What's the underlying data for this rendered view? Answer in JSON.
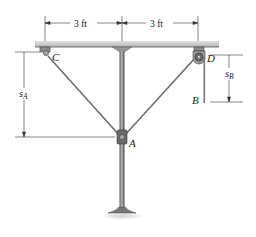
{
  "figure": {
    "dimensions": {
      "left_span": "3 ft",
      "right_span": "3 ft"
    },
    "labels": {
      "point_c": "C",
      "point_d": "D",
      "point_a": "A",
      "point_b": "B",
      "s_a_main": "s",
      "s_a_sub": "A",
      "s_b_main": "s",
      "s_b_sub": "B"
    },
    "colors": {
      "ceiling": "#c9c9c9",
      "post": "#8a8a8a",
      "cable": "#7a7a7a",
      "dim_line": "#333333"
    }
  }
}
